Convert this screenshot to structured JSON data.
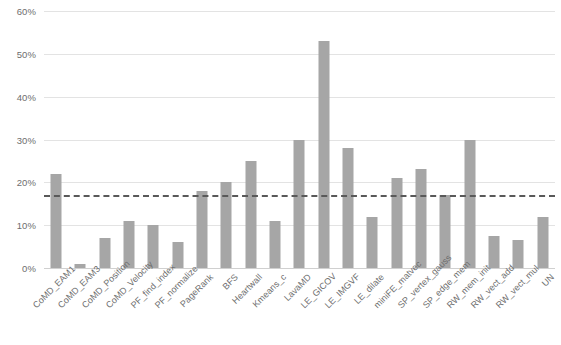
{
  "chart_data": {
    "type": "bar",
    "title": "",
    "subtitle": "",
    "xlabel": "",
    "ylabel": "",
    "ylim": [
      0,
      60
    ],
    "ytick_labels": [
      "0%",
      "10%",
      "20%",
      "30%",
      "40%",
      "50%",
      "60%"
    ],
    "ytick_values": [
      0,
      10,
      20,
      30,
      40,
      50,
      60
    ],
    "grid": true,
    "legend": "none",
    "value_suffix": "%",
    "bar_color": "#a6a6a6",
    "gridline_color": "#e3e3e3",
    "tick_label_color": "#6e6e6e",
    "reference_line": {
      "label": "",
      "value": 17,
      "style": "dashed",
      "color": "#595959"
    },
    "categories": [
      "CoMD_EAM1",
      "CoMD_EAM3",
      "CoMD_Position",
      "CoMD_Velocity",
      "PF_find_index",
      "PF_normalize",
      "PageRank",
      "BFS",
      "Heartwall",
      "Kmeans_c",
      "LavaMD",
      "LE_GICOV",
      "LE_IMGVF",
      "LE_dilate",
      "miniFE_matvec",
      "SP_vertex_gauss",
      "SP_edge_mem",
      "RW_mem_init",
      "RW_vect_add",
      "RW_vect_mul",
      "UN"
    ],
    "values": [
      22,
      1,
      7,
      11,
      10,
      6,
      18,
      20,
      25,
      11,
      30,
      53,
      28,
      12,
      21,
      23,
      17,
      30,
      7.5,
      6.5,
      12
    ]
  }
}
